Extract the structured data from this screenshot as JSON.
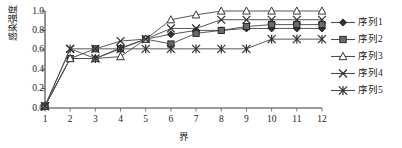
{
  "chart_data": {
    "type": "line",
    "title": "",
    "xlabel": "界",
    "ylabel": "感染强度",
    "xlim": [
      1,
      12
    ],
    "ylim": [
      0.0,
      1.0
    ],
    "grid": false,
    "legend_position": "right",
    "x": [
      1,
      2,
      3,
      4,
      5,
      6,
      7,
      8,
      9,
      10,
      11,
      12
    ],
    "xticklabels": [
      "1",
      "2",
      "3",
      "4",
      "5",
      "6",
      "7",
      "8",
      "9",
      "10",
      "11",
      "12"
    ],
    "yticklabels": [
      "0.0",
      "0.2",
      "0.4",
      "0.6",
      "0.8",
      "1.0"
    ],
    "yticks": [
      0.0,
      0.2,
      0.4,
      0.6,
      0.8,
      1.0
    ],
    "series": [
      {
        "name": "序列1",
        "marker": "diamond",
        "color": "#333333",
        "values": [
          0.02,
          0.51,
          0.51,
          0.62,
          0.71,
          0.76,
          0.8,
          0.8,
          0.82,
          0.82,
          0.82,
          0.82
        ]
      },
      {
        "name": "序列2",
        "marker": "square",
        "color": "#555555",
        "values": [
          0.02,
          0.51,
          0.61,
          0.61,
          0.71,
          0.66,
          0.77,
          0.8,
          0.84,
          0.86,
          0.86,
          0.86
        ]
      },
      {
        "name": "序列3",
        "marker": "triangle",
        "color": "#3a3a3a",
        "values": [
          0.02,
          0.51,
          0.51,
          0.53,
          0.71,
          0.91,
          0.96,
          1.0,
          1.0,
          1.0,
          1.0,
          1.0
        ]
      },
      {
        "name": "序列4",
        "marker": "x",
        "color": "#2f2f2f",
        "values": [
          0.02,
          0.61,
          0.61,
          0.69,
          0.71,
          0.82,
          0.82,
          0.91,
          0.91,
          0.91,
          0.91,
          0.91
        ]
      },
      {
        "name": "序列5",
        "marker": "asterisk",
        "color": "#2f2f2f",
        "values": [
          0.02,
          0.61,
          0.51,
          0.61,
          0.61,
          0.61,
          0.61,
          0.61,
          0.61,
          0.71,
          0.71,
          0.71
        ]
      }
    ]
  },
  "legend": {
    "items": [
      {
        "label": "序列1"
      },
      {
        "label": "序列2"
      },
      {
        "label": "序列3"
      },
      {
        "label": "序列4"
      },
      {
        "label": "序列5"
      }
    ]
  },
  "axes": {
    "y_title": "感染强度",
    "x_title": "界"
  }
}
